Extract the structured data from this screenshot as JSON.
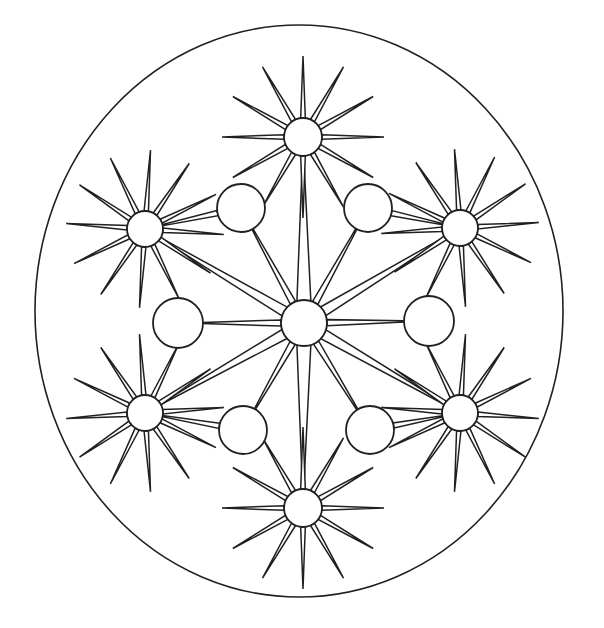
{
  "artwork": {
    "title": "Star Mandala Coloring Page",
    "kind": "line-art-mandala",
    "canvas": {
      "width": 604,
      "height": 628
    },
    "palette": {
      "background": "#ffffff",
      "ink": "#231f20",
      "fill": "#ffffff"
    },
    "outer_frame": {
      "name": "outer-boundary-circle",
      "shape": "ellipse",
      "cx": 299,
      "cy": 311,
      "rx": 264,
      "ry": 286,
      "stroke_width": 1.6
    },
    "center_star": {
      "name": "center-star",
      "cx": 304,
      "cy": 323,
      "hub_radius": 23,
      "ray_count": 12,
      "ray_half_width_deg": 7.0,
      "rotation_deg": 0,
      "ray_lengths": [
        168,
        96,
        96,
        122,
        96,
        96,
        168,
        96,
        96,
        122,
        96,
        96
      ],
      "ray_length_note": "alternating long rays reach the six satellite stars, shorter rays reach the six plain circles"
    },
    "satellite_stars": [
      {
        "name": "satellite-star-top",
        "cx": 303,
        "cy": 137,
        "hub_radius": 19,
        "ray_count": 12,
        "ray_length": 62,
        "rotation_deg": 0
      },
      {
        "name": "satellite-star-upper-left",
        "cx": 145,
        "cy": 229,
        "hub_radius": 18,
        "ray_count": 12,
        "ray_length": 61,
        "rotation_deg": 4
      },
      {
        "name": "satellite-star-upper-right",
        "cx": 460,
        "cy": 228,
        "hub_radius": 18,
        "ray_count": 12,
        "ray_length": 61,
        "rotation_deg": -4
      },
      {
        "name": "satellite-star-lower-left",
        "cx": 145,
        "cy": 413,
        "hub_radius": 18,
        "ray_count": 12,
        "ray_length": 61,
        "rotation_deg": -4
      },
      {
        "name": "satellite-star-lower-right",
        "cx": 460,
        "cy": 413,
        "hub_radius": 18,
        "ray_count": 12,
        "ray_length": 61,
        "rotation_deg": 4
      },
      {
        "name": "satellite-star-bottom",
        "cx": 303,
        "cy": 508,
        "hub_radius": 19,
        "ray_count": 12,
        "ray_length": 62,
        "rotation_deg": 0
      }
    ],
    "plain_circles": [
      {
        "name": "plain-circle-upper-left",
        "cx": 241,
        "cy": 208,
        "r": 24
      },
      {
        "name": "plain-circle-upper-right",
        "cx": 368,
        "cy": 208,
        "r": 24
      },
      {
        "name": "plain-circle-left",
        "cx": 178,
        "cy": 323,
        "r": 25
      },
      {
        "name": "plain-circle-right",
        "cx": 429,
        "cy": 321,
        "r": 25
      },
      {
        "name": "plain-circle-lower-left",
        "cx": 243,
        "cy": 430,
        "r": 24
      },
      {
        "name": "plain-circle-lower-right",
        "cx": 370,
        "cy": 430,
        "r": 24
      }
    ],
    "spokes": [
      {
        "name": "spoke-center-to-plain-upper-left",
        "from": "center",
        "to_x": 241,
        "to_y": 208,
        "to_r": 24,
        "half_width": 3.0
      },
      {
        "name": "spoke-center-to-plain-upper-right",
        "from": "center",
        "to_x": 368,
        "to_y": 208,
        "to_r": 24,
        "half_width": 3.0
      },
      {
        "name": "spoke-center-to-plain-left",
        "from": "center",
        "to_x": 178,
        "to_y": 323,
        "to_r": 25,
        "half_width": 3.0
      },
      {
        "name": "spoke-center-to-plain-right",
        "from": "center",
        "to_x": 429,
        "to_y": 321,
        "to_r": 25,
        "half_width": 3.0
      },
      {
        "name": "spoke-center-to-plain-lower-left",
        "from": "center",
        "to_x": 243,
        "to_y": 430,
        "to_r": 24,
        "half_width": 3.0
      },
      {
        "name": "spoke-center-to-plain-lower-right",
        "from": "center",
        "to_x": 370,
        "to_y": 430,
        "to_r": 24,
        "half_width": 3.0
      },
      {
        "name": "spoke-plain-upper-left-to-star",
        "from_x": 241,
        "from_y": 208,
        "from_r": 24,
        "to_x": 145,
        "to_y": 229,
        "to_r": 18,
        "half_width": 2.6
      },
      {
        "name": "spoke-plain-upper-right-to-star",
        "from_x": 368,
        "from_y": 208,
        "from_r": 24,
        "to_x": 460,
        "to_y": 228,
        "to_r": 18,
        "half_width": 2.6
      },
      {
        "name": "spoke-plain-lower-left-to-star",
        "from_x": 243,
        "from_y": 430,
        "from_r": 24,
        "to_x": 145,
        "to_y": 413,
        "to_r": 18,
        "half_width": 2.6
      },
      {
        "name": "spoke-plain-lower-right-to-star",
        "from_x": 370,
        "from_y": 430,
        "from_r": 24,
        "to_x": 460,
        "to_y": 413,
        "to_r": 18,
        "half_width": 2.6
      }
    ],
    "long_arms": [
      {
        "name": "long-arm-center-to-star-upper-left",
        "to_x": 145,
        "to_y": 229,
        "to_r": 18,
        "half_width": 4.0
      },
      {
        "name": "long-arm-center-to-star-upper-right",
        "to_x": 460,
        "to_y": 228,
        "to_r": 18,
        "half_width": 4.0
      },
      {
        "name": "long-arm-center-to-star-lower-left",
        "to_x": 145,
        "to_y": 413,
        "to_r": 18,
        "half_width": 4.0
      },
      {
        "name": "long-arm-center-to-star-lower-right",
        "to_x": 460,
        "to_y": 413,
        "to_r": 18,
        "half_width": 4.0
      },
      {
        "name": "long-arm-center-to-star-top",
        "to_x": 303,
        "to_y": 137,
        "to_r": 19,
        "half_width": 5.5
      },
      {
        "name": "long-arm-center-to-star-bottom",
        "to_x": 303,
        "to_y": 508,
        "to_r": 19,
        "half_width": 5.5
      }
    ],
    "counts": {
      "satellite_star_count": 6,
      "plain_circle_count": 6,
      "rays_per_star": 12,
      "center_ray_count": 12,
      "total_circles": 13
    }
  }
}
